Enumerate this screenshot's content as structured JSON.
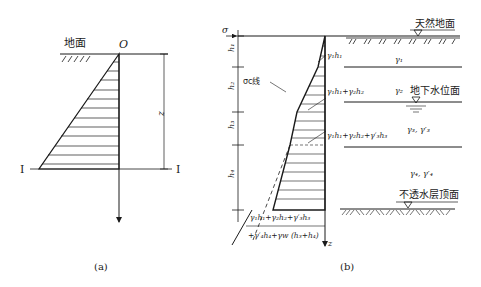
{
  "figure_a": {
    "ground_label": "地面",
    "origin_label": "O",
    "depth_label": "z",
    "section_left": "I",
    "section_right": "I",
    "caption": "(a)"
  },
  "figure_b": {
    "sigma_label": "σ",
    "sigma_sub": "c",
    "z_label": "z",
    "layers": [
      {
        "h": "h₁",
        "gamma": "γ₁"
      },
      {
        "h": "h₂",
        "gamma": "γ₂"
      },
      {
        "h": "h₃",
        "gamma": "γ₃, γ′₃"
      },
      {
        "h": "h₄",
        "gamma": "γ₄, γ′₄"
      }
    ],
    "sigma_line_label": "σc线",
    "stress_labels": [
      "γ₁h₁",
      "γ₁h₁+γ₂h₂",
      "γ₁h₁+γ₂h₂+γ′₃h₃",
      "γ₁h₁+γ₂h₂+γ′₃h₃",
      "+γ′₄h₄+γw (h₃+h₄)"
    ],
    "ground_surface": "天然地面",
    "water_table": "地下水位面",
    "impermeable_top": "不透水层顶面",
    "caption": "(b)"
  }
}
